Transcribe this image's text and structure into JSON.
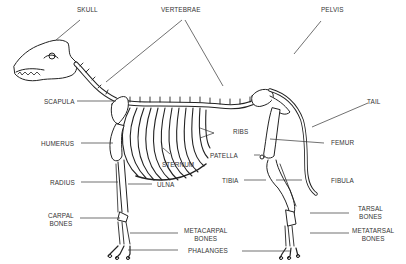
{
  "diagram": {
    "colors": {
      "line": "#222222",
      "text": "#333333",
      "background": "#ffffff"
    },
    "labels": {
      "skull": "SKULL",
      "vertebrae": "VERTEBRAE",
      "pelvis": "PELVIS",
      "scapula": "SCAPULA",
      "tail": "TAIL",
      "ribs": "RIBS",
      "humerus": "HUMERUS",
      "femur": "FEMUR",
      "sternum": "STERNUM",
      "patella": "PATELLA",
      "radius": "RADIUS",
      "ulna": "ULNA",
      "tibia": "TIBIA",
      "fibula": "FIBULA",
      "carpal_1": "CARPAL",
      "carpal_2": "BONES",
      "tarsal_1": "TARSAL",
      "tarsal_2": "BONES",
      "metacarpal_1": "METACARPAL",
      "metacarpal_2": "BONES",
      "metatarsal_1": "METATARSAL",
      "metatarsal_2": "BONES",
      "phalanges": "PHALANGES"
    }
  }
}
